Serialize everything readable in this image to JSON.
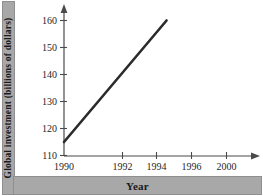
{
  "chart_data": {
    "type": "line",
    "title": "",
    "xlabel": "Year",
    "ylabel": "Global investment (billions of dollars)",
    "x": [
      1990,
      1996
    ],
    "values": [
      115,
      160
    ],
    "series": [
      {
        "name": "Global investment",
        "x": [
          1990,
          1996
        ],
        "values": [
          115,
          160
        ]
      }
    ],
    "xlim": [
      1990,
      2001
    ],
    "ylim": [
      110,
      163
    ],
    "xticks": [
      1990,
      1992,
      1994,
      1996,
      2000
    ],
    "xtick_labels": [
      "1990",
      "1992",
      "1994",
      "1996",
      "2000"
    ],
    "yticks": [
      110,
      120,
      130,
      140,
      150,
      160
    ],
    "ytick_labels": [
      "110",
      "120",
      "130",
      "140",
      "150",
      "160"
    ],
    "grid": false,
    "legend": null,
    "line_color": "#2b2b2b",
    "axis_color": "#4a4a4a",
    "band_color": "#a8a8a8",
    "annotations": []
  },
  "axis": {
    "x_label_text": "Year",
    "y_label_text": "Global investment (billions of dollars)"
  },
  "yticks": {
    "t0": "110",
    "t1": "120",
    "t2": "130",
    "t3": "140",
    "t4": "150",
    "t5": "160"
  },
  "xticks": {
    "t0": "1990",
    "t1": "1992",
    "t2": "1994",
    "t3": "1996",
    "t4": "2000"
  }
}
